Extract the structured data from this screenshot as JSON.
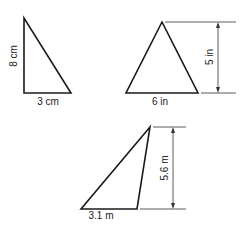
{
  "figure": {
    "stroke_color": "#1a1a1a",
    "background": "#ffffff"
  },
  "triangles": [
    {
      "id": "triangle-1",
      "type": "right",
      "base_label": "3 cm",
      "height_label": "8 cm",
      "base": 3,
      "height": 8,
      "unit": "cm"
    },
    {
      "id": "triangle-2",
      "type": "acute",
      "base_label": "6 in",
      "height_label": "5 in",
      "base": 6,
      "height": 5,
      "unit": "in"
    },
    {
      "id": "triangle-3",
      "type": "obtuse",
      "base_label": "3.1 m",
      "height_label": "5.6 m",
      "base": 3.1,
      "height": 5.6,
      "unit": "m"
    }
  ]
}
